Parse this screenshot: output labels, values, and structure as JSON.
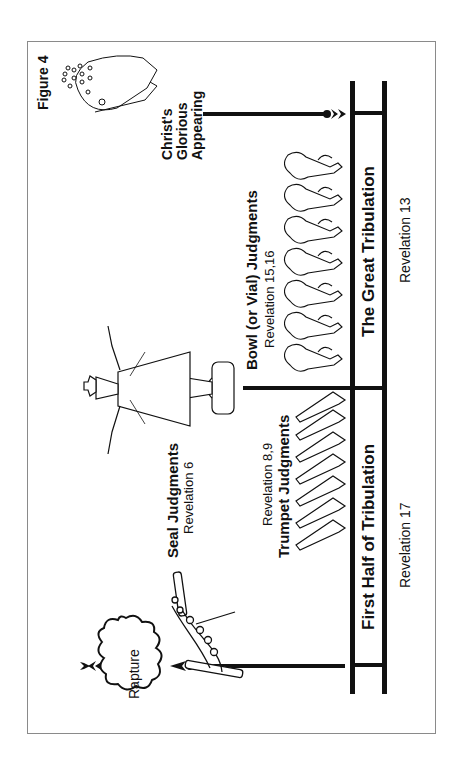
{
  "figure_label": "Figure 4",
  "events": {
    "christ": {
      "line1": "Christ's",
      "line2": "Glorious",
      "line3": "Appearing"
    },
    "rapture": "Rapture"
  },
  "judgments": {
    "seal": {
      "title": "Seal Judgments",
      "reference": "Revelation 6"
    },
    "trumpet": {
      "title": "Trumpet Judgments",
      "reference": "Revelation 8,9",
      "count": 7
    },
    "bowl": {
      "title": "Bowl (or Vial) Judgments",
      "reference": "Revelation 15,16",
      "count": 7
    }
  },
  "timeline": {
    "first_half": {
      "label": "First Half of Tribulation",
      "reference": "Revelation 17"
    },
    "second_half": {
      "label": "The Great Tribulation",
      "reference": "Revelation 13"
    }
  },
  "colors": {
    "ink": "#111111",
    "border": "#8a8a8a",
    "background": "#ffffff"
  }
}
